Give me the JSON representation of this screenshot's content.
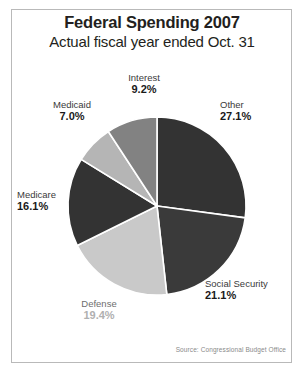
{
  "chart_data": {
    "type": "pie",
    "title": "Federal Spending 2007",
    "subtitle": "Actual fiscal year ended Oct. 31",
    "source": "Source: Congressional Budget Office",
    "xlabel": "",
    "ylabel": "",
    "legend_position": "callout-labels",
    "grid": false,
    "start_angle_deg": 0,
    "direction": "clockwise",
    "categories": [
      "Other",
      "Social Security",
      "Defense",
      "Medicare",
      "Medicaid",
      "Interest"
    ],
    "values": [
      27.1,
      21.1,
      19.4,
      16.1,
      7.0,
      9.2
    ],
    "total": 99.9,
    "slices": [
      {
        "label": "Other",
        "value": "27.1%",
        "number": 27.1,
        "color": "#333333"
      },
      {
        "label": "Social Security",
        "value": "21.1%",
        "number": 21.1,
        "color": "#3a3a3a"
      },
      {
        "label": "Defense",
        "value": "19.4%",
        "number": 19.4,
        "color": "#c9c9c9"
      },
      {
        "label": "Medicare",
        "value": "16.1%",
        "number": 16.1,
        "color": "#333333"
      },
      {
        "label": "Medicaid",
        "value": "7.0%",
        "number": 7.0,
        "color": "#b5b5b5"
      },
      {
        "label": "Interest",
        "value": "9.2%",
        "number": 9.2,
        "color": "#828282"
      }
    ]
  },
  "labels": {
    "interest": {
      "name": "Interest",
      "value": "9.2%"
    },
    "medicaid": {
      "name": "Medicaid",
      "value": "7.0%"
    },
    "other": {
      "name": "Other",
      "value": "27.1%"
    },
    "medicare": {
      "name": "Medicare",
      "value": "16.1%"
    },
    "social_security": {
      "name": "Social Security",
      "value": "21.1%"
    },
    "defense": {
      "name": "Defense",
      "value": "19.4%"
    }
  },
  "colors": {
    "frame": "#b9b9b9",
    "slice_divider": "#ffffff",
    "dark": "#333333",
    "mid": "#828282",
    "light": "#b5b5b5",
    "lightest": "#c9c9c9"
  }
}
